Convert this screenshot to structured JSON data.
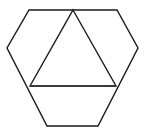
{
  "figure": {
    "name": "hexagon-with-inscribed-triangle",
    "background_color": "#ffffff",
    "stroke_color": "#1a1a1a",
    "stroke_width": 1.4,
    "fill": "none",
    "viewbox": "0 0 146 130",
    "shapes": [
      {
        "name": "hexagon",
        "type": "polygon",
        "points": "29,10 117,10 138,48 98,126 47,126 7,48",
        "stroke_color": "#1a1a1a",
        "stroke_width": 1.4,
        "fill": "none"
      },
      {
        "name": "inscribed-triangle",
        "type": "polygon",
        "points": "73,10 116,86 30,86",
        "stroke_color": "#1a1a1a",
        "stroke_width": 1.4,
        "fill": "none"
      },
      {
        "name": "triangle-base-chord",
        "type": "line",
        "points": "30,86 116,86",
        "stroke_color": "#3a3a3a",
        "stroke_width": 1.8,
        "fill": "none"
      }
    ],
    "vertices": {
      "hexagon": [
        {
          "label": "top-left",
          "x": 29,
          "y": 10
        },
        {
          "label": "top-right",
          "x": 117,
          "y": 10
        },
        {
          "label": "right",
          "x": 138,
          "y": 48
        },
        {
          "label": "bottom-right",
          "x": 98,
          "y": 126
        },
        {
          "label": "bottom-left",
          "x": 47,
          "y": 126
        },
        {
          "label": "left",
          "x": 7,
          "y": 48
        }
      ],
      "triangle": [
        {
          "label": "apex",
          "x": 73,
          "y": 10
        },
        {
          "label": "base-right",
          "x": 116,
          "y": 86
        },
        {
          "label": "base-left",
          "x": 30,
          "y": 86
        }
      ]
    },
    "labels": []
  }
}
